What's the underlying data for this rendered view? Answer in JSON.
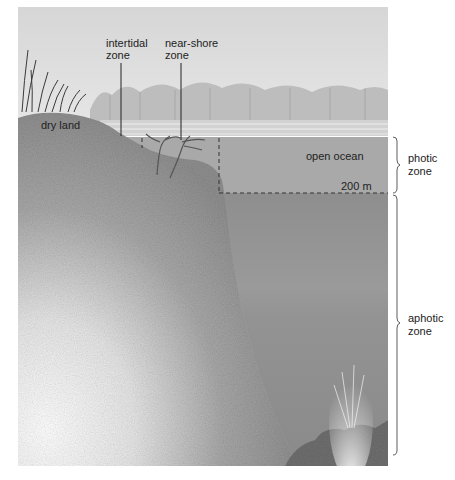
{
  "diagram": {
    "type": "ocean-zones-cross-section",
    "labels": {
      "intertidal": [
        "intertidal",
        "zone"
      ],
      "near_shore": [
        "near-shore",
        "zone"
      ],
      "dry_land": "dry land",
      "open_ocean": "open ocean",
      "depth_marker": "200 m",
      "photic": [
        "photic",
        "zone"
      ],
      "aphotic": [
        "aphotic",
        "zone"
      ]
    },
    "colors": {
      "sky": "#d9d9d9",
      "trees": "#b8b8b8",
      "photic_water": "#a9a9a9",
      "aphotic_water": "#8f8f8f",
      "land": "#c4c4c4",
      "land_dark": "#8a8a8a",
      "line": "#333333"
    }
  }
}
